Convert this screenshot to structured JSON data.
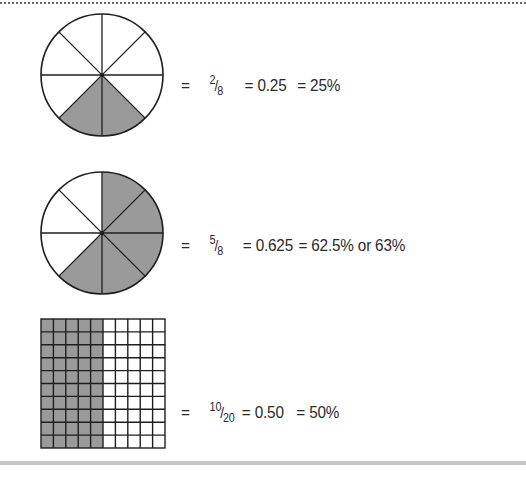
{
  "figures": [
    {
      "type": "circle",
      "divisions": 8,
      "shaded_count": 2,
      "equation": {
        "eq1": "=",
        "numerator": "2",
        "denominator": "8",
        "eq2": "= 0.25",
        "eq3": "= 25%"
      }
    },
    {
      "type": "circle",
      "divisions": 8,
      "shaded_count": 5,
      "equation": {
        "eq1": "=",
        "numerator": "5",
        "denominator": "8",
        "eq2": "= 0.625",
        "eq3": "= 62.5% or 63%"
      }
    },
    {
      "type": "grid",
      "columns": 10,
      "rows": 10,
      "shaded_columns": 5,
      "equation": {
        "eq1": "=",
        "numerator": "10",
        "denominator": "20",
        "eq2": "= 0.50",
        "eq3": "= 50%"
      }
    }
  ],
  "colors": {
    "shade": "#9a9a9a",
    "line": "#1e1e1e",
    "background": "#ffffff"
  }
}
